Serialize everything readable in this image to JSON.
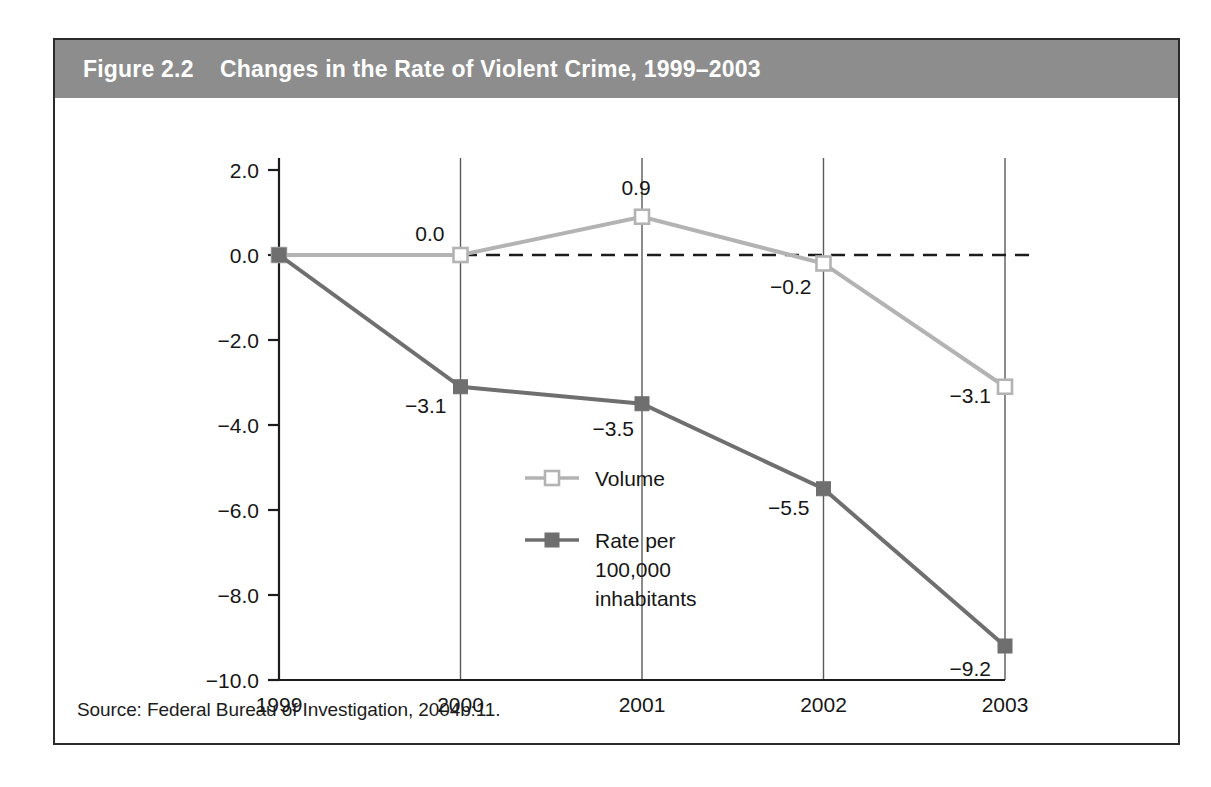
{
  "figure": {
    "label": "Figure 2.2",
    "title": "Changes in the Rate of Violent Crime, 1999–2003",
    "title_full": "Figure 2.2    Changes in the Rate of Violent Crime, 1999–2003",
    "source": "Source: Federal Bureau of Investigation, 2004b:11."
  },
  "colors": {
    "header_band": "#8d8d8d",
    "frame_border": "#2b2b2b",
    "volume_series": "#b3b3b3",
    "rate_series": "#6f6f6f",
    "axis": "#1c1c1c",
    "gridline": "#5a5a5a",
    "zero_line": "#1c1c1c",
    "background": "#ffffff"
  },
  "chart_data": {
    "type": "line",
    "title": "Changes in the Rate of Violent Crime, 1999–2003",
    "xlabel": "",
    "ylabel": "",
    "categories": [
      "1999",
      "2000",
      "2001",
      "2002",
      "2003"
    ],
    "x": [
      1999,
      2000,
      2001,
      2002,
      2003
    ],
    "ylim": [
      -10.0,
      2.0
    ],
    "yticks": [
      2.0,
      0.0,
      -2.0,
      -4.0,
      -6.0,
      -8.0,
      -10.0
    ],
    "ytick_labels": [
      "2.0",
      "0.0",
      "−2.0",
      "−4.0",
      "−6.0",
      "−8.0",
      "−10.0"
    ],
    "xtick_labels": [
      "1999",
      "2000",
      "2001",
      "2002",
      "2003"
    ],
    "grid": "vertical gridlines at each year",
    "legend_position": "inside center-left",
    "annotations": [
      {
        "text": "zero reference line (dashed) at y = 0.0"
      }
    ],
    "series": [
      {
        "name": "Volume",
        "color": "#b3b3b3",
        "marker": "open-square",
        "values": [
          0.0,
          0.0,
          0.9,
          -0.2,
          -3.1
        ],
        "data_labels": [
          "",
          "0.0",
          "0.9",
          "−0.2",
          "−3.1"
        ]
      },
      {
        "name": "Rate per 100,000 inhabitants",
        "color": "#6f6f6f",
        "marker": "filled-square",
        "values": [
          0.0,
          -3.1,
          -3.5,
          -5.5,
          -9.2
        ],
        "data_labels": [
          "",
          "−3.1",
          "−3.5",
          "−5.5",
          "−9.2"
        ]
      }
    ]
  },
  "legend": {
    "items": [
      {
        "label": "Volume",
        "lines": [
          "Volume"
        ]
      },
      {
        "label": "Rate per 100,000 inhabitants",
        "lines": [
          "Rate per",
          "100,000",
          "inhabitants"
        ]
      }
    ]
  }
}
